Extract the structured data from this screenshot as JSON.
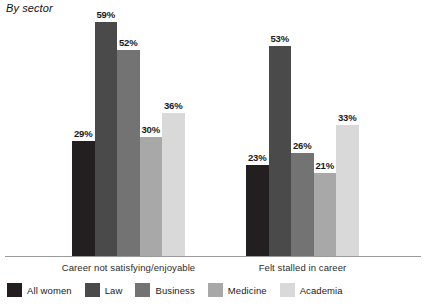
{
  "chart_data": {
    "type": "bar",
    "title": "By sector",
    "xlabel": "",
    "ylabel": "",
    "ylim": [
      0,
      65
    ],
    "grid": false,
    "legend_position": "bottom-left",
    "value_suffix": "%",
    "categories": [
      "Career not satisfying/enjoyable",
      "Felt stalled in career"
    ],
    "series": [
      {
        "name": "All women",
        "color": "#231f20",
        "values": [
          29,
          23
        ],
        "labels": [
          "29%",
          "23%"
        ]
      },
      {
        "name": "Law",
        "color": "#4a4a4a",
        "values": [
          59,
          53
        ],
        "labels": [
          "59%",
          "53%"
        ]
      },
      {
        "name": "Business",
        "color": "#737373",
        "values": [
          52,
          26
        ],
        "labels": [
          "52%",
          "26%"
        ]
      },
      {
        "name": "Medicine",
        "color": "#a8a8a8",
        "values": [
          30,
          21
        ],
        "labels": [
          "30%",
          "21%"
        ]
      },
      {
        "name": "Academia",
        "color": "#d9d9d9",
        "values": [
          36,
          33
        ],
        "labels": [
          "36%",
          "33%"
        ]
      }
    ]
  },
  "legend": {
    "items": [
      {
        "label": "All women",
        "color": "#231f20"
      },
      {
        "label": "Law",
        "color": "#4a4a4a"
      },
      {
        "label": "Business",
        "color": "#737373"
      },
      {
        "label": "Medicine",
        "color": "#a8a8a8"
      },
      {
        "label": "Academia",
        "color": "#d9d9d9"
      }
    ]
  },
  "axis": {
    "baseline_color": "#9a9a9a"
  }
}
